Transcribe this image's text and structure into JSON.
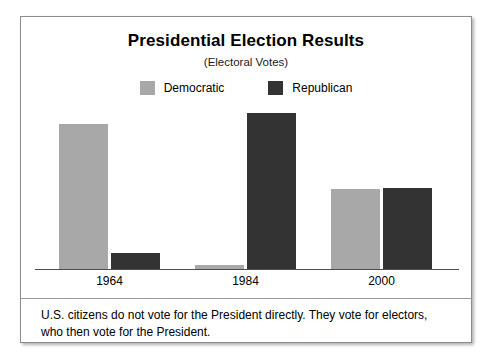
{
  "figure": {
    "title": "Presidential Election Results",
    "subtitle": "(Electoral Votes)",
    "footnote": "U.S. citizens do not vote for the President directly. They vote for electors, who then vote for the President."
  },
  "legend": {
    "items": [
      {
        "label": "Democratic",
        "color": "#a8a8a8",
        "swatch_name": "legend-swatch-democratic"
      },
      {
        "label": "Republican",
        "color": "#333333",
        "swatch_name": "legend-swatch-republican"
      }
    ]
  },
  "chart_data": {
    "type": "bar",
    "title": "Presidential Election Results",
    "subtitle": "(Electoral Votes)",
    "xlabel": "",
    "ylabel": "Electoral Votes",
    "categories": [
      "1964",
      "1984",
      "2000"
    ],
    "series": [
      {
        "name": "Democratic",
        "color": "#a8a8a8",
        "values": [
          486,
          13,
          266
        ]
      },
      {
        "name": "Republican",
        "color": "#333333",
        "values": [
          52,
          525,
          271
        ]
      }
    ],
    "ylim": [
      0,
      525
    ],
    "grid": false,
    "legend_position": "top-center",
    "axis_labels_visible": true,
    "value_labels_visible": false,
    "annotations": [
      "U.S. citizens do not vote for the President directly. They vote for electors, who then vote for the President."
    ]
  }
}
